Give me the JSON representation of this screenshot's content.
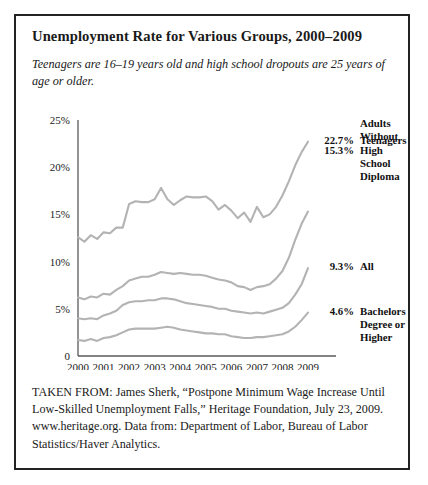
{
  "figure": {
    "title": "Unemployment Rate for Various Groups, 2000–2009",
    "subtitle": "Teenagers are 16–19 years old and high school dropouts are 25 years of age or older.",
    "caption": "TAKEN FROM: James Sherk, “Postpone Minimum Wage Increase Until Low-Skilled Unemployment Falls,” Heritage Foundation, July 23, 2009. www.heritage.org. Data from: Department of Labor, Bureau of Labor Statistics/Haver Analytics.",
    "border_color": "#232323",
    "background_color": "#ffffff"
  },
  "chart_data": {
    "type": "line",
    "title": "Unemployment Rate for Various Groups, 2000–2009",
    "xlabel": "",
    "ylabel": "",
    "xlim": [
      2000,
      2009
    ],
    "ylim": [
      0,
      25
    ],
    "grid": false,
    "legend_position": "right-inline-end-labels",
    "line_color": "#b3b3b3",
    "axis_color": "#5a5a5a",
    "ytick_labels": [
      "0",
      "5%",
      "10%",
      "15%",
      "20%",
      "25%"
    ],
    "ytick_values": [
      0,
      5,
      10,
      15,
      20,
      25
    ],
    "xtick_labels": [
      "2000",
      "2001",
      "2002",
      "2003",
      "2004",
      "2005",
      "2006",
      "2007",
      "2008",
      "2009"
    ],
    "xtick_values": [
      2000,
      2001,
      2002,
      2003,
      2004,
      2005,
      2006,
      2007,
      2008,
      2009
    ],
    "x": [
      2000.0,
      2000.25,
      2000.5,
      2000.75,
      2001.0,
      2001.25,
      2001.5,
      2001.75,
      2002.0,
      2002.25,
      2002.5,
      2002.75,
      2003.0,
      2003.25,
      2003.5,
      2003.75,
      2004.0,
      2004.25,
      2004.5,
      2004.75,
      2005.0,
      2005.25,
      2005.5,
      2005.75,
      2006.0,
      2006.25,
      2006.5,
      2006.75,
      2007.0,
      2007.25,
      2007.5,
      2007.75,
      2008.0,
      2008.25,
      2008.5,
      2008.75,
      2009.0
    ],
    "series": [
      {
        "name": "Teenagers",
        "end_label": "22.7%",
        "end_value": 22.7,
        "values": [
          12.6,
          12.1,
          12.8,
          12.4,
          13.1,
          13.0,
          13.6,
          13.6,
          16.1,
          16.4,
          16.3,
          16.3,
          16.6,
          17.8,
          16.6,
          16.0,
          16.5,
          16.9,
          16.8,
          16.8,
          16.9,
          16.4,
          15.5,
          16.0,
          15.4,
          14.6,
          15.2,
          14.2,
          15.8,
          14.7,
          15.0,
          15.8,
          17.0,
          18.5,
          20.2,
          21.6,
          22.7
        ]
      },
      {
        "name": "Adults Without High School Diploma",
        "end_label": "15.3%",
        "end_value": 15.3,
        "values": [
          6.2,
          6.0,
          6.3,
          6.2,
          6.6,
          6.5,
          7.0,
          7.4,
          8.0,
          8.2,
          8.4,
          8.4,
          8.6,
          8.9,
          8.8,
          8.7,
          8.8,
          8.7,
          8.6,
          8.6,
          8.5,
          8.3,
          8.1,
          8.0,
          7.8,
          7.4,
          7.3,
          7.0,
          7.3,
          7.4,
          7.6,
          8.2,
          9.0,
          10.4,
          12.3,
          14.0,
          15.3
        ]
      },
      {
        "name": "All",
        "end_label": "9.3%",
        "end_value": 9.3,
        "values": [
          4.0,
          3.9,
          4.0,
          3.9,
          4.3,
          4.5,
          4.8,
          5.4,
          5.7,
          5.8,
          5.8,
          5.9,
          5.9,
          6.1,
          6.1,
          6.0,
          5.8,
          5.6,
          5.5,
          5.4,
          5.3,
          5.2,
          5.0,
          5.0,
          4.8,
          4.7,
          4.6,
          4.5,
          4.6,
          4.5,
          4.7,
          4.9,
          5.1,
          5.6,
          6.5,
          7.6,
          9.3
        ]
      },
      {
        "name": "Bachelors Degree or Higher",
        "end_label": "4.6%",
        "end_value": 4.6,
        "values": [
          1.7,
          1.6,
          1.8,
          1.6,
          1.9,
          2.0,
          2.2,
          2.5,
          2.8,
          2.9,
          2.9,
          2.9,
          2.9,
          3.0,
          3.1,
          3.0,
          2.8,
          2.7,
          2.6,
          2.5,
          2.4,
          2.4,
          2.3,
          2.3,
          2.1,
          2.0,
          1.9,
          1.9,
          2.0,
          2.0,
          2.1,
          2.2,
          2.3,
          2.6,
          3.1,
          3.8,
          4.6
        ]
      }
    ],
    "end_labels": [
      {
        "value": "22.7%",
        "name": "Teenagers",
        "name_lines": [
          "Teenagers"
        ]
      },
      {
        "value": "15.3%",
        "name": "Adults Without High School Diploma",
        "name_lines": [
          "Adults",
          "Without",
          "High",
          "School",
          "Diploma"
        ]
      },
      {
        "value": "9.3%",
        "name": "All",
        "name_lines": [
          "All"
        ]
      },
      {
        "value": "4.6%",
        "name": "Bachelors Degree or Higher",
        "name_lines": [
          "Bachelors",
          "Degree or",
          "Higher"
        ]
      }
    ]
  }
}
